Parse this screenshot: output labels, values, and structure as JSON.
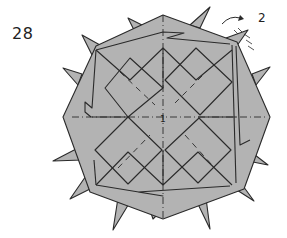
{
  "diagram": {
    "type": "origami-step",
    "step_number": "28",
    "callout_number": "2",
    "center_label": "1",
    "colors": {
      "paper_fill": "#b3b3b3",
      "line": "#2a2a2a",
      "background": "#ffffff"
    },
    "annotations": [
      {
        "kind": "arrow",
        "description": "curved rotate/flip arrow near top-right spike"
      },
      {
        "kind": "pleat-marks",
        "description": "short hatch marks on top-right spike"
      },
      {
        "kind": "crease",
        "description": "dash-dot vertical and horizontal axis lines through center"
      },
      {
        "kind": "crease",
        "description": "dashed diagonal valley folds in each of four diamond squares"
      }
    ]
  }
}
